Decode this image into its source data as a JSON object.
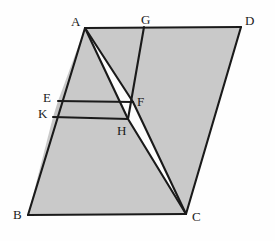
{
  "figure": {
    "type": "geometry-diagram",
    "canvas": {
      "width": 275,
      "height": 241
    },
    "colors": {
      "background": "#fefefe",
      "stroke": "#1a1a1a",
      "fill_light": "#c9c9c9",
      "fill_medium": "#c3c3c3",
      "fill_white": "#fdfdfd",
      "label_color": "#1a1a1a"
    },
    "stroke_width": 2.1,
    "points": {
      "A": {
        "x": 85,
        "y": 28,
        "label": "A",
        "label_x": 71,
        "label_y": 15
      },
      "B": {
        "x": 28,
        "y": 215,
        "label": "B",
        "label_x": 13,
        "label_y": 208
      },
      "C": {
        "x": 186,
        "y": 214,
        "label": "C",
        "label_x": 192,
        "label_y": 210
      },
      "D": {
        "x": 241,
        "y": 27,
        "label": "D",
        "label_x": 245,
        "label_y": 14
      },
      "E": {
        "x": 58,
        "y": 101,
        "label": "E",
        "label_x": 43,
        "label_y": 91
      },
      "F": {
        "x": 133,
        "y": 102,
        "label": "F",
        "label_x": 137,
        "label_y": 95
      },
      "G": {
        "x": 144,
        "y": 27,
        "label": "G",
        "label_x": 141,
        "label_y": 13
      },
      "H": {
        "x": 128,
        "y": 119,
        "label": "H",
        "label_x": 117,
        "label_y": 124
      },
      "K": {
        "x": 53,
        "y": 117,
        "label": "K",
        "label_x": 38,
        "label_y": 107
      }
    },
    "regions": [
      {
        "name": "region-parallelogram-right-gcd",
        "path": "M144,27 L241,27 L186,214 L128,119 Z",
        "fill": "fill_light"
      },
      {
        "name": "region-left-lower-bkhc",
        "path": "M53,117 L128,119 L186,214 L28,215 Z",
        "fill": "fill_light"
      },
      {
        "name": "region-strip-efhk",
        "path": "M58,101 L133,102 L128,119 L53,117 Z",
        "fill": "fill_medium"
      },
      {
        "name": "region-upper-aegf",
        "path": "M85,28 L144,27 L133,102 L58,101 Z",
        "fill": "fill_light"
      },
      {
        "name": "region-wedge-a-f-h",
        "path": "M85,28 L133,102 L128,119 Z",
        "fill": "fill_white"
      },
      {
        "name": "region-wedge-f-h-c",
        "path": "M133,102 L186,214 L128,119 Z",
        "fill": "fill_white"
      }
    ],
    "segments": [
      {
        "name": "segment-AD",
        "from": "A",
        "to": "D"
      },
      {
        "name": "segment-AB",
        "from": "A",
        "to": "B"
      },
      {
        "name": "segment-BC",
        "from": "B",
        "to": "C"
      },
      {
        "name": "segment-CD",
        "from": "C",
        "to": "D"
      },
      {
        "name": "segment-GH",
        "from": "G",
        "to": "H"
      },
      {
        "name": "segment-AF",
        "from": "A",
        "to": "F"
      },
      {
        "name": "segment-FC",
        "from": "F",
        "to": "C"
      },
      {
        "name": "segment-AH",
        "from": "A",
        "to": "H"
      },
      {
        "name": "segment-HC",
        "from": "H",
        "to": "C"
      },
      {
        "name": "segment-EF",
        "from": "E",
        "to": "F"
      },
      {
        "name": "segment-KH",
        "from": "K",
        "to": "H"
      }
    ],
    "labels": [
      "A",
      "G",
      "D",
      "E",
      "F",
      "K",
      "H",
      "B",
      "C"
    ]
  }
}
